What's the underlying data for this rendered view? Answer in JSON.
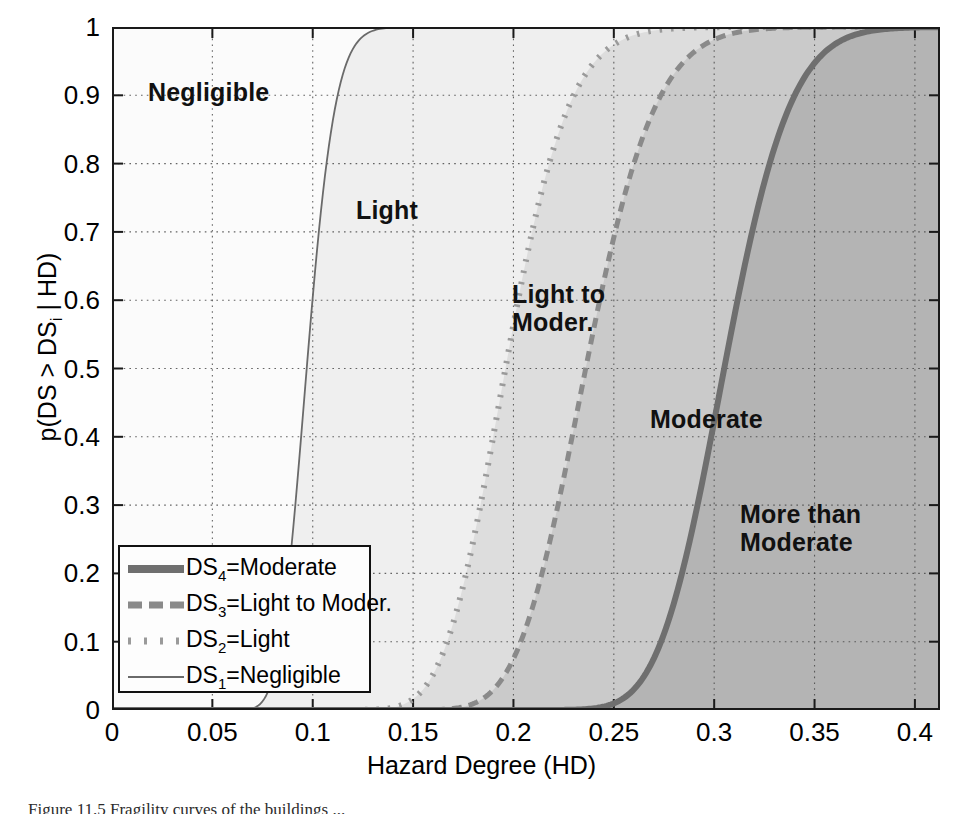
{
  "axes": {
    "xlabel": "Hazard Degree (HD)",
    "ylabel_main": "p(DS > DS",
    "ylabel_sub": "i",
    "ylabel_tail": " | HD)",
    "xticks": [
      "0",
      "0.05",
      "0.1",
      "0.15",
      "0.2",
      "0.25",
      "0.3",
      "0.35",
      "0.4"
    ],
    "yticks": [
      "0",
      "0.1",
      "0.2",
      "0.3",
      "0.4",
      "0.5",
      "0.6",
      "0.7",
      "0.8",
      "0.9",
      "1"
    ],
    "xlim": [
      0,
      0.4125
    ],
    "ylim": [
      0,
      1
    ],
    "grid": "dotted"
  },
  "regions": [
    {
      "name": "negligible",
      "text": "Negligible",
      "x": 148,
      "y": 78,
      "fill": "#fbfbfb"
    },
    {
      "name": "light",
      "text": "Light",
      "x": 356,
      "y": 196,
      "fill": "#efefef"
    },
    {
      "name": "light-to-moderate",
      "text": "Light to\nModer.",
      "x": 512,
      "y": 280,
      "fill": "#dddddd"
    },
    {
      "name": "moderate",
      "text": "Moderate",
      "x": 650,
      "y": 405,
      "fill": "#cacaca"
    },
    {
      "name": "more-than-moderate",
      "text": "More than\nModerate",
      "x": 740,
      "y": 500,
      "fill": "#b4b4b4"
    }
  ],
  "legend": {
    "position": "lower-left",
    "entries": [
      {
        "label_prefix": "DS",
        "index": "4",
        "label_suffix": "=Moderate",
        "style": "solid-thick",
        "color": "#6f6f6f"
      },
      {
        "label_prefix": "DS",
        "index": "3",
        "label_suffix": "=Light to Moder.",
        "style": "dashed",
        "color": "#8a8a8a"
      },
      {
        "label_prefix": "DS",
        "index": "2",
        "label_suffix": "=Light",
        "style": "dotted",
        "color": "#9a9a9a"
      },
      {
        "label_prefix": "DS",
        "index": "1",
        "label_suffix": "=Negligible",
        "style": "solid-thin",
        "color": "#6a6a6a"
      }
    ]
  },
  "caption": "Figure 11.5   Fragility curves of the buildings ... ",
  "chart_data": {
    "type": "line",
    "title": "",
    "xlabel": "Hazard Degree (HD)",
    "ylabel": "p(DS > DS_i | HD)",
    "xlim": [
      0,
      0.4125
    ],
    "ylim": [
      0,
      1
    ],
    "xticks": [
      0,
      0.05,
      0.1,
      0.15,
      0.2,
      0.25,
      0.3,
      0.35,
      0.4
    ],
    "yticks": [
      0,
      0.1,
      0.2,
      0.3,
      0.4,
      0.5,
      0.6,
      0.7,
      0.8,
      0.9,
      1.0
    ],
    "grid": true,
    "legend_position": "lower left",
    "x": [
      0.0,
      0.02,
      0.04,
      0.05,
      0.06,
      0.07,
      0.08,
      0.085,
      0.09,
      0.095,
      0.1,
      0.105,
      0.11,
      0.115,
      0.12,
      0.13,
      0.14,
      0.15,
      0.16,
      0.17,
      0.18,
      0.19,
      0.2,
      0.21,
      0.22,
      0.23,
      0.24,
      0.25,
      0.26,
      0.27,
      0.28,
      0.29,
      0.3,
      0.31,
      0.32,
      0.33,
      0.34,
      0.35,
      0.36,
      0.38,
      0.4,
      0.4125
    ],
    "series": [
      {
        "name": "DS1=Negligible",
        "style": "solid-thin",
        "median": 0.097,
        "beta": 0.115,
        "values": [
          0.0,
          0.0,
          0.01,
          0.03,
          0.08,
          0.17,
          0.3,
          0.38,
          0.46,
          0.54,
          0.62,
          0.69,
          0.75,
          0.8,
          0.84,
          0.91,
          0.95,
          0.975,
          0.99,
          0.995,
          0.998,
          1.0,
          1.0,
          1.0,
          1.0,
          1.0,
          1.0,
          1.0,
          1.0,
          1.0,
          1.0,
          1.0,
          1.0,
          1.0,
          1.0,
          1.0,
          1.0,
          1.0,
          1.0,
          1.0,
          1.0,
          1.0
        ]
      },
      {
        "name": "DS2=Light",
        "style": "dotted",
        "median": 0.196,
        "beta": 0.125,
        "values": [
          0.0,
          0.0,
          0.0,
          0.0,
          0.0,
          0.0,
          0.0,
          0.0,
          0.0,
          0.0,
          0.0,
          0.0,
          0.0,
          0.005,
          0.01,
          0.03,
          0.06,
          0.11,
          0.18,
          0.27,
          0.37,
          0.47,
          0.56,
          0.66,
          0.74,
          0.81,
          0.87,
          0.92,
          0.95,
          0.97,
          0.985,
          0.993,
          0.997,
          0.999,
          1.0,
          1.0,
          1.0,
          1.0,
          1.0,
          1.0,
          1.0,
          1.0
        ]
      },
      {
        "name": "DS3=Light to Moder.",
        "style": "dashed",
        "median": 0.236,
        "beta": 0.115,
        "values": [
          0.0,
          0.0,
          0.0,
          0.0,
          0.0,
          0.0,
          0.0,
          0.0,
          0.0,
          0.0,
          0.0,
          0.0,
          0.0,
          0.0,
          0.0,
          0.0,
          0.01,
          0.02,
          0.04,
          0.07,
          0.12,
          0.19,
          0.27,
          0.36,
          0.45,
          0.55,
          0.64,
          0.72,
          0.79,
          0.85,
          0.9,
          0.94,
          0.965,
          0.98,
          0.99,
          0.995,
          0.998,
          1.0,
          1.0,
          1.0,
          1.0,
          1.0
        ]
      },
      {
        "name": "DS4=Moderate",
        "style": "solid-thick",
        "median": 0.305,
        "beta": 0.085,
        "values": [
          0.0,
          0.0,
          0.0,
          0.0,
          0.0,
          0.0,
          0.0,
          0.0,
          0.0,
          0.0,
          0.0,
          0.0,
          0.0,
          0.0,
          0.0,
          0.0,
          0.0,
          0.0,
          0.0,
          0.0,
          0.0,
          0.0,
          0.0,
          0.0,
          0.005,
          0.01,
          0.02,
          0.04,
          0.09,
          0.17,
          0.29,
          0.42,
          0.56,
          0.69,
          0.79,
          0.87,
          0.93,
          0.96,
          0.98,
          0.997,
          1.0,
          1.0
        ]
      }
    ]
  }
}
